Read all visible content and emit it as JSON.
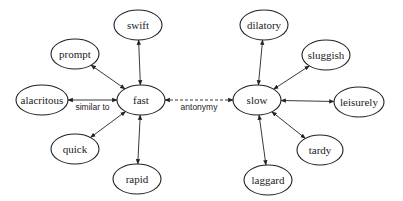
{
  "diagram": {
    "nodes": [
      {
        "id": "fast",
        "label": "fast"
      },
      {
        "id": "slow",
        "label": "slow"
      },
      {
        "id": "swift",
        "label": "swift"
      },
      {
        "id": "prompt",
        "label": "prompt"
      },
      {
        "id": "alacritous",
        "label": "alacritous"
      },
      {
        "id": "quick",
        "label": "quick"
      },
      {
        "id": "rapid",
        "label": "rapid"
      },
      {
        "id": "dilatory",
        "label": "dilatory"
      },
      {
        "id": "sluggish",
        "label": "sluggish"
      },
      {
        "id": "leisurely",
        "label": "leisurely"
      },
      {
        "id": "tardy",
        "label": "tardy"
      },
      {
        "id": "laggard",
        "label": "laggard"
      }
    ],
    "edges": [
      {
        "from": "fast",
        "to": "swift",
        "style": "solid",
        "label": ""
      },
      {
        "from": "fast",
        "to": "prompt",
        "style": "solid",
        "label": ""
      },
      {
        "from": "fast",
        "to": "alacritous",
        "style": "solid",
        "label": "similar to"
      },
      {
        "from": "fast",
        "to": "quick",
        "style": "solid",
        "label": ""
      },
      {
        "from": "fast",
        "to": "rapid",
        "style": "solid",
        "label": ""
      },
      {
        "from": "fast",
        "to": "slow",
        "style": "dashed",
        "label": "antonymy"
      },
      {
        "from": "slow",
        "to": "dilatory",
        "style": "solid",
        "label": ""
      },
      {
        "from": "slow",
        "to": "sluggish",
        "style": "solid",
        "label": ""
      },
      {
        "from": "slow",
        "to": "leisurely",
        "style": "solid",
        "label": ""
      },
      {
        "from": "slow",
        "to": "tardy",
        "style": "solid",
        "label": ""
      },
      {
        "from": "slow",
        "to": "laggard",
        "style": "solid",
        "label": ""
      }
    ]
  }
}
